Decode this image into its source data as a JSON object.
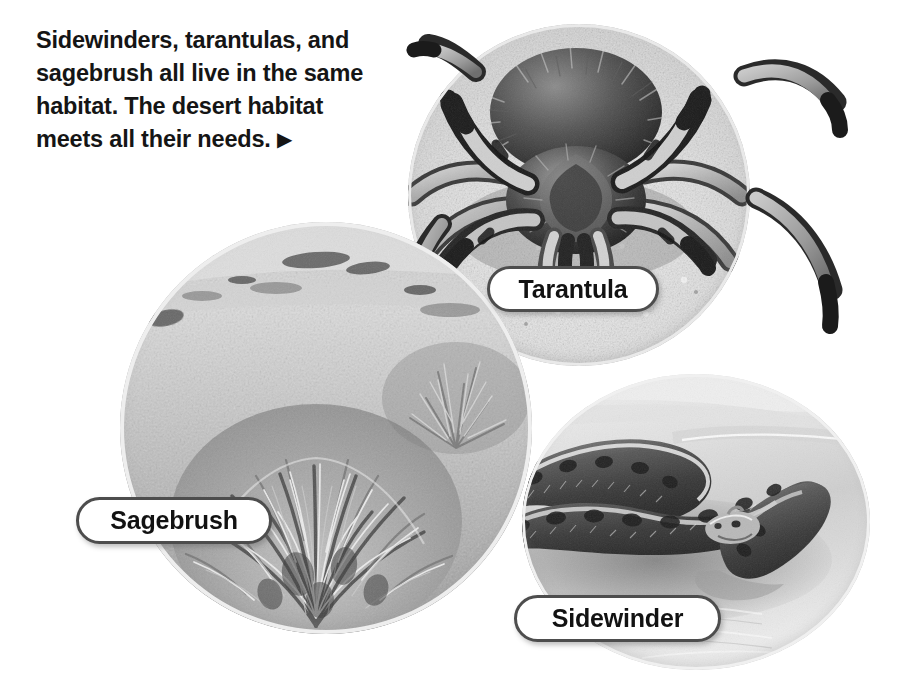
{
  "page": {
    "background_color": "#ffffff",
    "width": 904,
    "height": 699
  },
  "caption": {
    "text": "Sidewinders, tarantulas, and\nsagebrush all live in the same\nhabitat. The desert habitat\nmeets all their needs. ",
    "arrow_glyph": "▶",
    "text_color": "#151515"
  },
  "labels": {
    "tarantula": "Tarantula",
    "sagebrush": "Sagebrush",
    "sidewinder": "Sidewinder",
    "border_color": "#4d4d4d",
    "fill_color": "#ffffff",
    "text_color": "#121212"
  },
  "photos": {
    "tarantula": {
      "subject": "tarantula-on-sand",
      "description": "Close-up grayscale photograph of a hairy tarantula standing on pale desert sand, legs spreading beyond the circular crop."
    },
    "sagebrush": {
      "subject": "sagebrush-plant",
      "description": "Grayscale photograph of a bushy sagebrush plant growing on dry open desert ground."
    },
    "sidewinder": {
      "subject": "sidewinder-rattlesnake",
      "description": "Grayscale photograph of a coiled sidewinder rattlesnake resting on rippled desert sand."
    }
  }
}
